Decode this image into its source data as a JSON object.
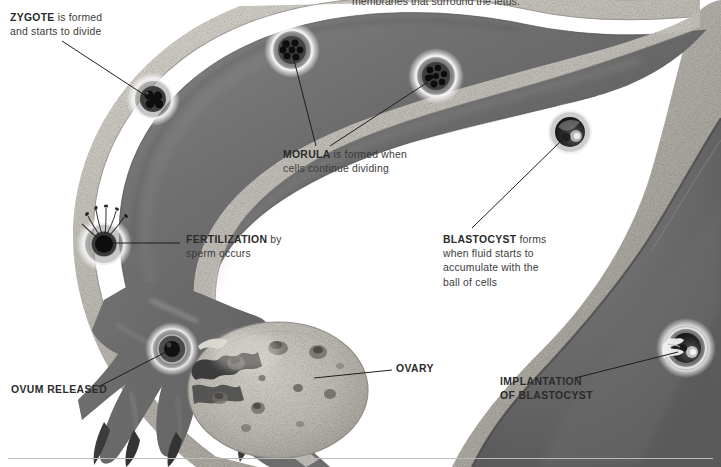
{
  "figure": {
    "clipped_header": "membranes that surround the fetus."
  },
  "annotations": {
    "zygote": {
      "keyword": "ZYGOTE",
      "line1_rest": " is formed",
      "line2": "and starts to divide"
    },
    "morula": {
      "keyword": "MORULA",
      "line1_rest": " is formed when",
      "line2": "cells continue dividing"
    },
    "fertilization": {
      "keyword": "FERTILIZATION",
      "line1_rest": " by",
      "line2": "sperm occurs"
    },
    "blastocyst": {
      "keyword": "BLASTOCYST",
      "line1_rest": " forms",
      "line2": "when fluid starts to",
      "line3": "accumulate with the",
      "line4": "ball of cells"
    },
    "ovum_released": {
      "label": "OVUM RELEASED"
    },
    "ovary": {
      "label": "OVARY"
    },
    "implantation": {
      "line1": "IMPLANTATION",
      "line2": "OF BLASTOCYST"
    }
  },
  "structures": [
    {
      "name": "fallopian-tube",
      "label": "Fallopian tube"
    },
    {
      "name": "fimbriae",
      "label": "Fimbriae"
    },
    {
      "name": "ovary",
      "label": "Ovary"
    },
    {
      "name": "uterus-wall",
      "label": "Uterine wall"
    },
    {
      "name": "uterine-cavity",
      "label": "Uterine cavity"
    }
  ],
  "stages": [
    {
      "name": "ovum",
      "label": "Ovum released",
      "x": 172,
      "y": 349
    },
    {
      "name": "fertilization",
      "label": "Fertilization",
      "x": 104,
      "y": 244
    },
    {
      "name": "zygote",
      "label": "Zygote",
      "x": 153,
      "y": 99
    },
    {
      "name": "morula-early",
      "label": "Morula (early)",
      "x": 292,
      "y": 50
    },
    {
      "name": "morula-late",
      "label": "Morula (late)",
      "x": 436,
      "y": 76
    },
    {
      "name": "blastocyst",
      "label": "Blastocyst",
      "x": 570,
      "y": 132
    },
    {
      "name": "implantation",
      "label": "Implantation",
      "x": 686,
      "y": 348
    }
  ],
  "colors": {
    "text": "#3b3b3b",
    "keyword": "#2b2b2b",
    "leader_line": "#1e1e1e",
    "tube_lumen": "#6e6e6e",
    "tube_wall": "#cfcbc4",
    "ovary_fill": "#c9c6c0",
    "uterus_wall": "#b4b1ab",
    "background": "#ffffff",
    "rule": "#b9b9b9"
  }
}
